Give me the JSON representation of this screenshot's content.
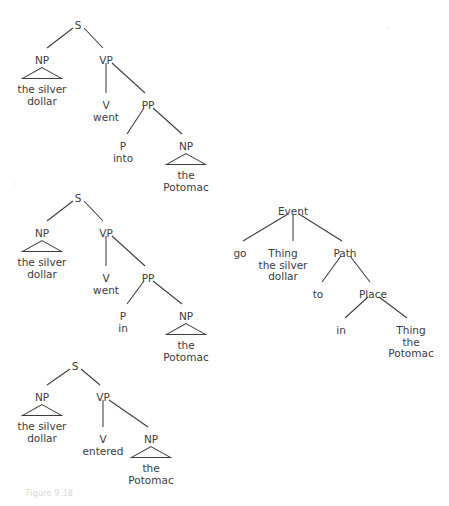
{
  "figure": {
    "caption": "Figure 9.18",
    "background": "#ffffff",
    "ink": "#3c3c3c"
  },
  "trees": [
    {
      "id": "tree-went-into",
      "name": "phrase-structure-tree-went-into",
      "nodes": [
        {
          "key": "s",
          "label": "S",
          "x": 78,
          "y": 20
        },
        {
          "key": "np",
          "label": "NP",
          "x": 42,
          "y": 55
        },
        {
          "key": "np_lex",
          "label": "the silver\ndollar",
          "x": 42,
          "y": 84
        },
        {
          "key": "vp",
          "label": "VP",
          "x": 106,
          "y": 55
        },
        {
          "key": "v",
          "label": "V\nwent",
          "x": 106,
          "y": 100
        },
        {
          "key": "pp",
          "label": "PP",
          "x": 148,
          "y": 100
        },
        {
          "key": "p",
          "label": "P\ninto",
          "x": 123,
          "y": 141
        },
        {
          "key": "np2",
          "label": "NP",
          "x": 186,
          "y": 141
        },
        {
          "key": "np2_lex",
          "label": "the\nPotomac",
          "x": 186,
          "y": 170
        }
      ],
      "triangles": [
        {
          "key": "np-tri",
          "cx": 42,
          "top": 67,
          "halfWidth": 20,
          "height": 12
        },
        {
          "key": "np2-tri",
          "cx": 186,
          "top": 153,
          "halfWidth": 20,
          "height": 12
        }
      ],
      "edges": [
        {
          "from": "S",
          "to": "NP",
          "x1": 73,
          "y1": 28,
          "x2": 47,
          "y2": 48
        },
        {
          "from": "S",
          "to": "VP",
          "x1": 84,
          "y1": 28,
          "x2": 103,
          "y2": 48
        },
        {
          "from": "VP",
          "to": "V",
          "x1": 106,
          "y1": 63,
          "x2": 106,
          "y2": 93
        },
        {
          "from": "VP",
          "to": "PP",
          "x1": 112,
          "y1": 63,
          "x2": 145,
          "y2": 93
        },
        {
          "from": "PP",
          "to": "P",
          "x1": 144,
          "y1": 108,
          "x2": 127,
          "y2": 134
        },
        {
          "from": "PP",
          "to": "NP",
          "x1": 153,
          "y1": 108,
          "x2": 182,
          "y2": 134
        }
      ]
    },
    {
      "id": "tree-went-in",
      "name": "phrase-structure-tree-went-in",
      "nodes": [
        {
          "key": "s",
          "label": "S",
          "x": 78,
          "y": 193
        },
        {
          "key": "np",
          "label": "NP",
          "x": 42,
          "y": 228
        },
        {
          "key": "np_lex",
          "label": "the silver\ndollar",
          "x": 42,
          "y": 257
        },
        {
          "key": "vp",
          "label": "VP",
          "x": 106,
          "y": 228
        },
        {
          "key": "v",
          "label": "V\nwent",
          "x": 106,
          "y": 273
        },
        {
          "key": "pp",
          "label": "PP",
          "x": 148,
          "y": 273
        },
        {
          "key": "p",
          "label": "P\nin",
          "x": 123,
          "y": 311
        },
        {
          "key": "np2",
          "label": "NP",
          "x": 186,
          "y": 311
        },
        {
          "key": "np2_lex",
          "label": "the\nPotomac",
          "x": 186,
          "y": 340
        }
      ],
      "triangles": [
        {
          "key": "np-tri",
          "cx": 42,
          "top": 240,
          "halfWidth": 20,
          "height": 12
        },
        {
          "key": "np2-tri",
          "cx": 186,
          "top": 323,
          "halfWidth": 20,
          "height": 12
        }
      ],
      "edges": [
        {
          "from": "S",
          "to": "NP",
          "x1": 73,
          "y1": 201,
          "x2": 47,
          "y2": 221
        },
        {
          "from": "S",
          "to": "VP",
          "x1": 84,
          "y1": 201,
          "x2": 103,
          "y2": 221
        },
        {
          "from": "VP",
          "to": "V",
          "x1": 106,
          "y1": 236,
          "x2": 106,
          "y2": 266
        },
        {
          "from": "VP",
          "to": "PP",
          "x1": 112,
          "y1": 236,
          "x2": 145,
          "y2": 266
        },
        {
          "from": "PP",
          "to": "P",
          "x1": 144,
          "y1": 281,
          "x2": 127,
          "y2": 304
        },
        {
          "from": "PP",
          "to": "NP",
          "x1": 153,
          "y1": 281,
          "x2": 182,
          "y2": 304
        }
      ]
    },
    {
      "id": "tree-entered",
      "name": "phrase-structure-tree-entered",
      "nodes": [
        {
          "key": "s",
          "label": "S",
          "x": 75,
          "y": 361
        },
        {
          "key": "np",
          "label": "NP",
          "x": 42,
          "y": 392
        },
        {
          "key": "np_lex",
          "label": "the silver\ndollar",
          "x": 42,
          "y": 421
        },
        {
          "key": "vp",
          "label": "VP",
          "x": 103,
          "y": 392
        },
        {
          "key": "v",
          "label": "V\nentered",
          "x": 103,
          "y": 434
        },
        {
          "key": "np2",
          "label": "NP",
          "x": 151,
          "y": 434
        },
        {
          "key": "np2_lex",
          "label": "the\nPotomac",
          "x": 151,
          "y": 463
        }
      ],
      "triangles": [
        {
          "key": "np-tri",
          "cx": 42,
          "top": 404,
          "halfWidth": 20,
          "height": 12
        },
        {
          "key": "np2-tri",
          "cx": 151,
          "top": 446,
          "halfWidth": 20,
          "height": 12
        }
      ],
      "edges": [
        {
          "from": "S",
          "to": "NP",
          "x1": 70,
          "y1": 369,
          "x2": 47,
          "y2": 385
        },
        {
          "from": "S",
          "to": "VP",
          "x1": 81,
          "y1": 369,
          "x2": 100,
          "y2": 385
        },
        {
          "from": "VP",
          "to": "V",
          "x1": 103,
          "y1": 400,
          "x2": 103,
          "y2": 427
        },
        {
          "from": "VP",
          "to": "NP",
          "x1": 109,
          "y1": 400,
          "x2": 148,
          "y2": 427
        }
      ]
    },
    {
      "id": "tree-event",
      "name": "conceptual-structure-tree-event",
      "nodes": [
        {
          "key": "event",
          "label": "Event",
          "x": 293,
          "y": 206
        },
        {
          "key": "go",
          "label": "go",
          "x": 240,
          "y": 248
        },
        {
          "key": "thing1",
          "label": "Thing\nthe silver\ndollar",
          "x": 283,
          "y": 248
        },
        {
          "key": "path",
          "label": "Path",
          "x": 345,
          "y": 248
        },
        {
          "key": "to",
          "label": "to",
          "x": 318,
          "y": 289
        },
        {
          "key": "place",
          "label": "Place",
          "x": 373,
          "y": 289
        },
        {
          "key": "in",
          "label": "in",
          "x": 341,
          "y": 325
        },
        {
          "key": "thing2",
          "label": "Thing\nthe\nPotomac",
          "x": 411,
          "y": 325
        }
      ],
      "triangles": [],
      "edges": [
        {
          "from": "Event",
          "to": "go",
          "x1": 288,
          "y1": 214,
          "x2": 243,
          "y2": 241
        },
        {
          "from": "Event",
          "to": "Thing",
          "x1": 293,
          "y1": 214,
          "x2": 293,
          "y2": 241
        },
        {
          "from": "Event",
          "to": "Path",
          "x1": 299,
          "y1": 214,
          "x2": 342,
          "y2": 241
        },
        {
          "from": "Path",
          "to": "to",
          "x1": 341,
          "y1": 256,
          "x2": 322,
          "y2": 282
        },
        {
          "from": "Path",
          "to": "Place",
          "x1": 350,
          "y1": 256,
          "x2": 370,
          "y2": 282
        },
        {
          "from": "Place",
          "to": "in",
          "x1": 368,
          "y1": 297,
          "x2": 345,
          "y2": 318
        },
        {
          "from": "Place",
          "to": "Thing",
          "x1": 379,
          "y1": 297,
          "x2": 407,
          "y2": 318
        }
      ]
    }
  ]
}
